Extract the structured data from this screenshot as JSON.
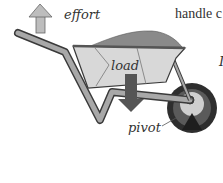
{
  "diagram": {
    "labels": {
      "effort": "effort",
      "load": "load",
      "pivot": "pivot"
    },
    "side_text": {
      "top_line": "handle c",
      "second_line_fragment": "I"
    },
    "colors": {
      "frame": "#9a9a9a",
      "frame_outline": "#3a3a3a",
      "tray": "#d8d8d8",
      "soil": "#8a8a8a",
      "arrow": "#555555",
      "effort_arrow": "#bdbdbd",
      "tyre": "#2e2e2e",
      "hub": "#cfcfcf",
      "text": "#333333"
    }
  }
}
